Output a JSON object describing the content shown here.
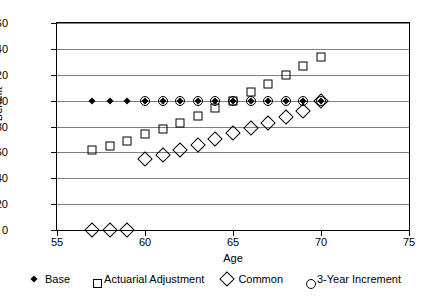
{
  "chart_data": {
    "type": "scatter",
    "title": "",
    "xlabel": "Age",
    "ylabel": "Benefit",
    "xlim": [
      55,
      75
    ],
    "ylim": [
      0,
      160
    ],
    "xticks": [
      55,
      60,
      65,
      70,
      75
    ],
    "yticks": [
      0,
      20,
      40,
      60,
      80,
      100,
      120,
      140,
      160
    ],
    "grid": true,
    "legend_position": "bottom",
    "x": [
      57,
      58,
      59,
      60,
      61,
      62,
      63,
      64,
      65,
      66,
      67,
      68,
      69,
      70
    ],
    "series": [
      {
        "name": "Base",
        "marker": "filled-diamond",
        "x": [
          57,
          58,
          59,
          60,
          61,
          62,
          63,
          64,
          65,
          66,
          67,
          68,
          69,
          70
        ],
        "values": [
          100,
          100,
          100,
          100,
          100,
          100,
          100,
          100,
          100,
          100,
          100,
          100,
          100,
          100
        ]
      },
      {
        "name": "Actuarial Adjustment",
        "marker": "square",
        "x": [
          57,
          58,
          59,
          60,
          61,
          62,
          63,
          64,
          65,
          66,
          67,
          68,
          69,
          70
        ],
        "values": [
          62,
          65,
          69,
          74,
          78,
          83,
          88,
          94,
          100,
          107,
          113,
          120,
          127,
          134
        ]
      },
      {
        "name": "Common",
        "marker": "diamond",
        "x": [
          57,
          58,
          59,
          60,
          61,
          62,
          63,
          64,
          65,
          66,
          67,
          68,
          69,
          70
        ],
        "values": [
          0,
          0,
          0,
          55,
          58,
          62,
          66,
          70,
          75,
          79,
          83,
          87,
          92,
          100
        ]
      },
      {
        "name": "3-Year Increment",
        "marker": "circle",
        "x": [
          60,
          61,
          62,
          63,
          64,
          65,
          66,
          67,
          68,
          69,
          70
        ],
        "values": [
          100,
          100,
          100,
          100,
          100,
          100,
          100,
          100,
          100,
          100,
          100
        ]
      }
    ]
  },
  "legend": {
    "items": [
      {
        "label": "Base",
        "marker": "filled-diamond"
      },
      {
        "label": "Actuarial Adjustment",
        "marker": "square"
      },
      {
        "label": "Common",
        "marker": "diamond"
      },
      {
        "label": "3-Year Increment",
        "marker": "circle"
      }
    ]
  },
  "axes": {
    "y_title": "Benefit",
    "x_title": "Age"
  },
  "colors": {
    "marker": "#000000",
    "grid": "#808080",
    "axis": "#000000",
    "background": "#ffffff"
  }
}
